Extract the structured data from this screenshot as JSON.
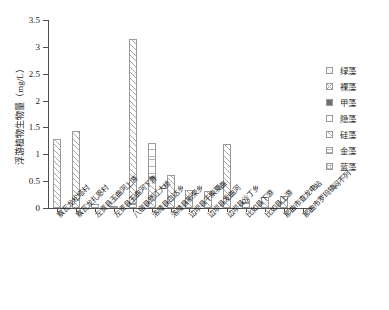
{
  "chart_data": {
    "type": "bar",
    "title": "",
    "subtitle": "",
    "xlabel": "",
    "ylabel": "浮游植物生物量（mg/L）",
    "ylim": [
      0,
      3.5
    ],
    "yticks": [
      0,
      0.5,
      1,
      1.5,
      2,
      2.5,
      3,
      3.5
    ],
    "ytick_labels": [
      "0",
      "0.5",
      "1",
      "1.5",
      "2",
      "2.5",
      "3",
      "3.5"
    ],
    "grid": false,
    "legend_position": "right",
    "stacked": true,
    "categories": [
      "察瓦龙松塔村",
      "察瓦龙扎恩村",
      "左贡县玉曲河上游",
      "左贡县玉曲河下游",
      "八宿县怒江大桥",
      "洛隆县白达乡",
      "洛隆县新荣乡",
      "边坝县干柴戛曲",
      "边坝县发曲河",
      "边坝县沙丁乡",
      "比如县下游",
      "比如县上游",
      "那曲市查龙电站",
      "那曲市罗玛镇闷不列"
    ],
    "series": [
      {
        "name": "绿藻",
        "pattern": "light",
        "values": [
          0.0,
          0.0,
          0.0,
          0.0,
          0.0,
          0.0,
          0.0,
          0.0,
          0.0,
          0.0,
          0.0,
          0.0,
          0.0,
          0.0
        ]
      },
      {
        "name": "裸藻",
        "pattern": "cross",
        "values": [
          0.0,
          0.0,
          0.0,
          0.0,
          0.0,
          0.0,
          0.0,
          0.0,
          0.0,
          0.0,
          0.0,
          0.0,
          0.0,
          0.0
        ]
      },
      {
        "name": "甲藻",
        "pattern": "solid",
        "values": [
          0.0,
          0.0,
          0.0,
          0.0,
          0.0,
          0.0,
          0.0,
          0.0,
          0.0,
          0.0,
          0.0,
          0.0,
          0.0,
          0.0
        ]
      },
      {
        "name": "隐藻",
        "pattern": "plain",
        "values": [
          0.0,
          0.0,
          0.07,
          0.03,
          0.07,
          0.0,
          0.0,
          0.0,
          0.0,
          0.0,
          0.09,
          0.0,
          0.0,
          0.0
        ]
      },
      {
        "name": "硅藻",
        "pattern": "diag",
        "values": [
          1.28,
          1.44,
          0.0,
          0.0,
          3.08,
          0.55,
          0.61,
          0.33,
          0.31,
          1.19,
          0.08,
          0.2,
          0.23,
          0.0
        ]
      },
      {
        "name": "金藻",
        "pattern": "grid",
        "values": [
          0.0,
          0.0,
          0.0,
          0.0,
          0.0,
          0.66,
          0.0,
          0.0,
          0.0,
          0.0,
          0.0,
          0.0,
          0.0,
          0.0
        ]
      },
      {
        "name": "蓝藻",
        "pattern": "dot",
        "values": [
          0.0,
          0.0,
          0.0,
          0.0,
          0.0,
          0.0,
          0.0,
          0.0,
          0.0,
          0.0,
          0.0,
          0.0,
          0.0,
          0.0
        ]
      }
    ],
    "totals": [
      1.28,
      1.44,
      0.07,
      0.03,
      3.15,
      1.21,
      0.61,
      0.33,
      0.31,
      1.19,
      0.17,
      0.2,
      0.23,
      0.0
    ]
  },
  "legend": {
    "items": [
      {
        "label": "绿藻"
      },
      {
        "label": "裸藻"
      },
      {
        "label": "甲藻"
      },
      {
        "label": "隐藻"
      },
      {
        "label": "硅藻"
      },
      {
        "label": "金藻"
      },
      {
        "label": "蓝藻"
      }
    ]
  },
  "colors": {
    "axis": "#4d4d4d",
    "text": "#1a1a1a",
    "hatch": "#a8a8a8",
    "background": "#ffffff"
  }
}
